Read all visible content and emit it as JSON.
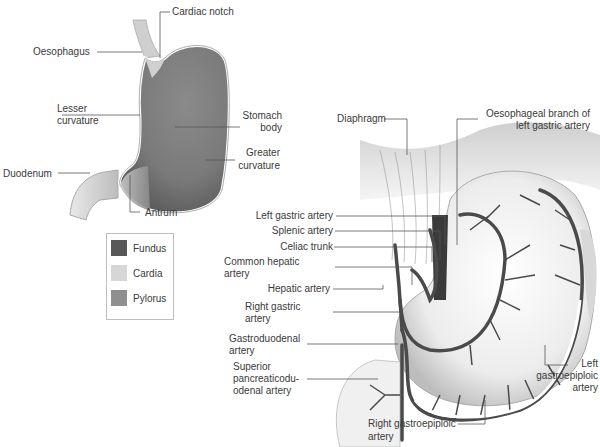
{
  "figure": {
    "left_panel": {
      "title": "Stomach regions",
      "labels": {
        "cardiac_notch": "Cardiac notch",
        "oesophagus": "Oesophagus",
        "lesser_curvature_1": "Lesser",
        "lesser_curvature_2": "curvature",
        "stomach_body_1": "Stomach",
        "stomach_body_2": "body",
        "greater_curvature_1": "Greater",
        "greater_curvature_2": "curvature",
        "duodenum": "Duodenum",
        "antrum": "Antrum"
      },
      "legend": [
        {
          "label": "Fundus",
          "color": "#585858"
        },
        {
          "label": "Cardia",
          "color": "#d6d6d6"
        },
        {
          "label": "Pylorus",
          "color": "#8f8f8f"
        }
      ]
    },
    "right_panel": {
      "title": "Arterial supply of the stomach",
      "labels": {
        "diaphragm": "Diaphragm",
        "oesophageal_branch_1": "Oesophageal branch of",
        "oesophageal_branch_2": "left gastric artery",
        "left_gastric": "Left gastric artery",
        "splenic": "Splenic artery",
        "celiac": "Celiac trunk",
        "common_hepatic_1": "Common hepatic",
        "common_hepatic_2": "artery",
        "hepatic": "Hepatic artery",
        "right_gastric_1": "Right gastric",
        "right_gastric_2": "artery",
        "gastroduodenal_1": "Gastroduodenal",
        "gastroduodenal_2": "artery",
        "sup_pancreatico_1": "Superior",
        "sup_pancreatico_2": "pancreaticodu-",
        "sup_pancreatico_3": "odenal artery",
        "left_gastroepiploic_1": "Left",
        "left_gastroepiploic_2": "gastroepiploic",
        "left_gastroepiploic_3": "artery",
        "right_gastroepiploic_1": "Right gastroepiploic",
        "right_gastroepiploic_2": "artery"
      }
    },
    "colors": {
      "stomach_dark": "#5a5a5a",
      "stomach_mid": "#8c8c8c",
      "stomach_light": "#d8d8d8",
      "artery": "#4a4a4a",
      "leader_line": "#555555"
    }
  }
}
